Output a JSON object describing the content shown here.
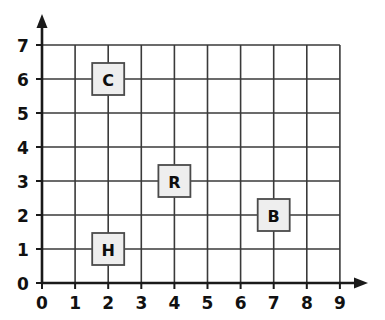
{
  "chart_data": {
    "type": "scatter",
    "title": "",
    "xlabel": "",
    "ylabel": "",
    "xlim": [
      0,
      9
    ],
    "ylim": [
      0,
      7
    ],
    "grid": true,
    "legend": "none",
    "x_ticks": [
      "0",
      "1",
      "2",
      "3",
      "4",
      "5",
      "6",
      "7",
      "8",
      "9"
    ],
    "y_ticks": [
      "0",
      "1",
      "2",
      "3",
      "4",
      "5",
      "6",
      "7"
    ],
    "x_tick_values": [
      0,
      1,
      2,
      3,
      4,
      5,
      6,
      7,
      8,
      9
    ],
    "y_tick_values": [
      0,
      1,
      2,
      3,
      4,
      5,
      6,
      7
    ],
    "points": [
      {
        "label": "C",
        "x": 2,
        "y": 6
      },
      {
        "label": "R",
        "x": 4,
        "y": 3
      },
      {
        "label": "B",
        "x": 7,
        "y": 2
      },
      {
        "label": "H",
        "x": 2,
        "y": 1
      }
    ]
  },
  "figure": {
    "background_color": "#ffffff",
    "grid_line_color": "#3a3a3a",
    "axis_color": "#1a1a1a",
    "marker_fill_color": "#eeeeee",
    "marker_border_color": "#4a4a4a",
    "label_text_color": "#111111"
  },
  "axes": {
    "x_axis_name": "x-axis",
    "y_axis_name": "y-axis",
    "x_arrow": "arrow-right",
    "y_arrow": "arrow-up"
  }
}
